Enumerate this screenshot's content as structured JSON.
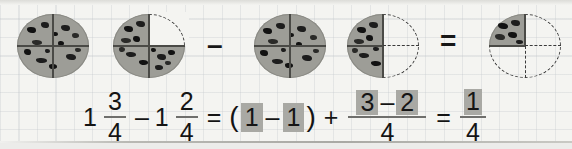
{
  "figures": {
    "cookie_1": {
      "name": "whole-cookie",
      "fraction": "4/4",
      "shaded_quarters": [
        "top-left",
        "top-right",
        "bottom-left",
        "bottom-right"
      ]
    },
    "cookie_2": {
      "name": "three-quarter-cookie",
      "fraction": "3/4",
      "shaded_quarters": [
        "top-left",
        "bottom-left",
        "bottom-right"
      ],
      "missing_quarters": [
        "top-right"
      ]
    },
    "cookie_3": {
      "name": "whole-cookie",
      "fraction": "4/4",
      "shaded_quarters": [
        "top-left",
        "top-right",
        "bottom-left",
        "bottom-right"
      ]
    },
    "cookie_4": {
      "name": "two-quarter-cookie",
      "fraction": "2/4",
      "shaded_quarters": [
        "top-left",
        "bottom-left"
      ],
      "missing_quarters": [
        "top-right",
        "bottom-right"
      ]
    },
    "cookie_5": {
      "name": "one-quarter-cookie",
      "fraction": "1/4",
      "shaded_quarters": [
        "top-left"
      ],
      "missing_quarters": [
        "top-right",
        "bottom-left",
        "bottom-right"
      ]
    },
    "operator_minus": "–",
    "operator_equals": "="
  },
  "equation": {
    "term1": {
      "whole": "1",
      "numerator": "3",
      "denominator": "4"
    },
    "op1": "–",
    "term2": {
      "whole": "1",
      "numerator": "2",
      "denominator": "4"
    },
    "equals1": "=",
    "open_paren": "(",
    "group_left": "1",
    "group_op": "–",
    "group_right": "1",
    "close_paren": ")",
    "plus": "+",
    "term3": {
      "numerator_left": "3",
      "numerator_op": "–",
      "numerator_right": "2",
      "denominator": "4"
    },
    "equals2": "=",
    "result": {
      "numerator": "1",
      "denominator": "4"
    }
  },
  "colors": {
    "page_background": "#f4f4f1",
    "grid_line": "#bec3c8",
    "cookie_body": "#9d9d97",
    "chocolate_chip": "#1d1d1d",
    "highlight_box": "#a9a9a4",
    "text": "#141414",
    "dashed_outline": "#3a3a3a"
  }
}
